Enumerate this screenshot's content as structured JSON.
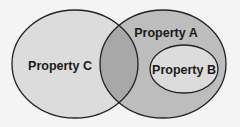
{
  "diagram": {
    "type": "venn",
    "sets": [
      {
        "id": "C",
        "label": "Property C",
        "fill": "#dcdcdc"
      },
      {
        "id": "A",
        "label": "Property A",
        "fill": "#bdbdbd"
      },
      {
        "id": "B",
        "label": "Property B",
        "fill": "#dcdcdc",
        "subset_of": "A"
      }
    ],
    "intersection_fill": "#a8a8a8",
    "stroke": "#222222",
    "background": "#f4f4f4"
  }
}
